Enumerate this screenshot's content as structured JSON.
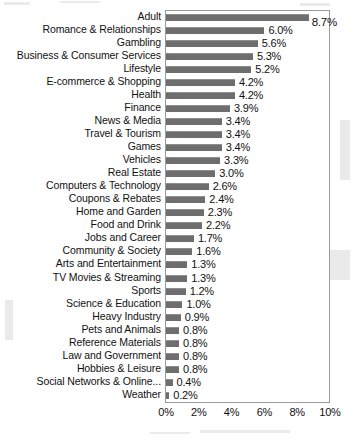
{
  "chart_data": {
    "type": "bar",
    "orientation": "horizontal",
    "title": "",
    "subtitle": "",
    "xlabel": "",
    "ylabel": "",
    "xlim": [
      0,
      10
    ],
    "xticks": [
      "0%",
      "2%",
      "4%",
      "6%",
      "8%",
      "10%"
    ],
    "xtick_values": [
      0,
      2,
      4,
      6,
      8,
      10
    ],
    "grid": false,
    "legend": null,
    "bar_color": "#6e6e6e",
    "categories": [
      "Adult",
      "Romance & Relationships",
      "Gambling",
      "Business & Consumer Services",
      "Lifestyle",
      "E-commerce & Shopping",
      "Health",
      "Finance",
      "News & Media",
      "Travel & Tourism",
      "Games",
      "Vehicles",
      "Real Estate",
      "Computers & Technology",
      "Coupons & Rebates",
      "Home and Garden",
      "Food and Drink",
      "Jobs and Career",
      "Community & Society",
      "Arts and Entertainment",
      "TV Movies & Streaming",
      "Sports",
      "Science & Education",
      "Heavy Industry",
      "Pets and Animals",
      "Reference Materials",
      "Law and Government",
      "Hobbies & Leisure",
      "Social Networks & Online...",
      "Weather"
    ],
    "values": [
      8.7,
      6.0,
      5.6,
      5.3,
      5.2,
      4.2,
      4.2,
      3.9,
      3.4,
      3.4,
      3.4,
      3.3,
      3.0,
      2.6,
      2.4,
      2.3,
      2.2,
      1.7,
      1.6,
      1.3,
      1.3,
      1.2,
      1.0,
      0.9,
      0.8,
      0.8,
      0.8,
      0.8,
      0.4,
      0.2
    ],
    "value_labels": [
      "8.7%",
      "6.0%",
      "5.6%",
      "5.3%",
      "5.2%",
      "4.2%",
      "4.2%",
      "3.9%",
      "3.4%",
      "3.4%",
      "3.4%",
      "3.3%",
      "3.0%",
      "2.6%",
      "2.4%",
      "2.3%",
      "2.2%",
      "1.7%",
      "1.6%",
      "1.3%",
      "1.3%",
      "1.2%",
      "1.0%",
      "0.9%",
      "0.8%",
      "0.8%",
      "0.8%",
      "0.8%",
      "0.4%",
      "0.2%"
    ]
  }
}
